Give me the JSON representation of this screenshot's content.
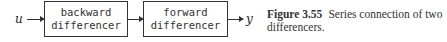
{
  "diagram": {
    "input_label": "u",
    "output_label": "y",
    "blocks": [
      {
        "line1": "backward",
        "line2": "differencer"
      },
      {
        "line1": "forward",
        "line2": "differencer"
      }
    ]
  },
  "caption": {
    "figure_label": "Figure 3.55",
    "text": "Series connection of two differencers."
  }
}
